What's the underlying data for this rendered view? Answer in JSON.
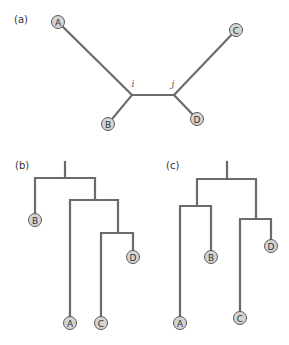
{
  "panels": {
    "a": {
      "label": "(a)",
      "type": "unrooted",
      "junctions": {
        "i": "i",
        "j": "j"
      },
      "leaves": {
        "A": "A",
        "B": "B",
        "C": "C",
        "D": "D"
      }
    },
    "b": {
      "label": "(b)",
      "type": "rooted",
      "topology": "(B,(A,(C,D)))",
      "leaves": {
        "A": "A",
        "B": "B",
        "C": "C",
        "D": "D"
      }
    },
    "c": {
      "label": "(c)",
      "type": "rooted",
      "topology": "((A,B),(C,D))",
      "leaves": {
        "A": "A",
        "B": "B",
        "C": "C",
        "D": "D"
      }
    }
  },
  "colors": {
    "branch": "#6b6b6b",
    "node_fill": "#d4d4d4",
    "node_stroke": "#5a5a5a"
  }
}
